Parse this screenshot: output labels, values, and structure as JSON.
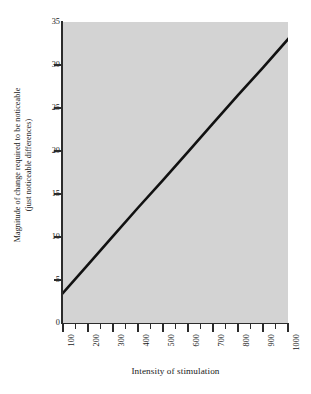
{
  "chart_data": {
    "type": "line",
    "title": "",
    "xlabel": "Intensity of stimulation",
    "ylabel_line1": "Magnitude of change required to be noticeable",
    "ylabel_line2": "(just noticeable differences)",
    "xlim": [
      100,
      1000
    ],
    "ylim": [
      0,
      35
    ],
    "grid": false,
    "legend": "none",
    "background_color": "#d3d3d3",
    "line_color": "#111111",
    "x_ticks": [
      100,
      200,
      300,
      400,
      500,
      600,
      700,
      800,
      900,
      1000
    ],
    "x_tick_labels": [
      "100",
      "200",
      "300",
      "400",
      "500",
      "600",
      "700",
      "800",
      "900",
      "1000"
    ],
    "x_minor_ticks": [
      150,
      250,
      350,
      450,
      550,
      650,
      750,
      850,
      950
    ],
    "y_ticks": [
      0,
      5,
      10,
      15,
      20,
      25,
      30,
      35
    ],
    "y_tick_labels": [
      "0",
      "5",
      "10",
      "15",
      "20",
      "25",
      "30",
      "35"
    ],
    "series": [
      {
        "name": "Weber's law",
        "x": [
          100,
          200,
          300,
          400,
          500,
          600,
          700,
          800,
          900,
          1000
        ],
        "values": [
          3.5,
          6.8,
          10.1,
          13.4,
          16.6,
          19.9,
          23.2,
          26.5,
          29.7,
          33.0
        ]
      }
    ]
  }
}
